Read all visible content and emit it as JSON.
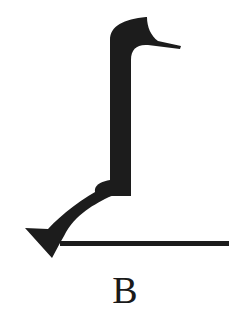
{
  "figure": {
    "label": "B",
    "colors": {
      "ink": "#1c1c1c",
      "background": "#ffffff"
    },
    "parts": [
      {
        "name": "hooked-head",
        "description": "curved head with pointed beak extending right"
      },
      {
        "name": "vertical-shaft",
        "description": "thick vertical bar"
      },
      {
        "name": "joint",
        "description": "small rounded knuckle at bend"
      },
      {
        "name": "angled-segment",
        "description": "tapered diagonal arm down-left"
      },
      {
        "name": "triangular-foot",
        "description": "triangular tip at lower-left"
      },
      {
        "name": "baseline",
        "description": "horizontal line extending right from foot"
      }
    ]
  }
}
